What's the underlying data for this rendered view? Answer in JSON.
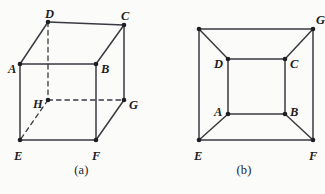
{
  "page": {
    "background_color": "#fbfbf9",
    "ink_color": "#3a3a42",
    "label_color": "#1d1d22",
    "width": 325,
    "height": 194
  },
  "figures": [
    {
      "id": "figure-a",
      "caption": "(a)",
      "description": "Cube drawn in oblique projection with hidden edges dashed",
      "vertices": [
        {
          "name": "D",
          "x": 48,
          "y": 22,
          "label_x": 45,
          "label_y": 14,
          "hidden": false
        },
        {
          "name": "C",
          "x": 124,
          "y": 25,
          "label_x": 121,
          "label_y": 16,
          "hidden": false
        },
        {
          "name": "A",
          "x": 20,
          "y": 64,
          "label_x": 8,
          "label_y": 69,
          "hidden": false
        },
        {
          "name": "B",
          "x": 96,
          "y": 64,
          "label_x": 101,
          "label_y": 69,
          "hidden": false
        },
        {
          "name": "H",
          "x": 48,
          "y": 100,
          "label_x": 33,
          "label_y": 104,
          "hidden": true
        },
        {
          "name": "G",
          "x": 124,
          "y": 100,
          "label_x": 129,
          "label_y": 105,
          "hidden": false
        },
        {
          "name": "E",
          "x": 20,
          "y": 140,
          "label_x": 14,
          "label_y": 156,
          "hidden": false
        },
        {
          "name": "F",
          "x": 96,
          "y": 140,
          "label_x": 92,
          "label_y": 156,
          "hidden": false
        }
      ],
      "edges": [
        {
          "from": "D",
          "to": "C",
          "style": "solid"
        },
        {
          "from": "D",
          "to": "A",
          "style": "solid"
        },
        {
          "from": "C",
          "to": "B",
          "style": "solid"
        },
        {
          "from": "A",
          "to": "B",
          "style": "solid"
        },
        {
          "from": "A",
          "to": "E",
          "style": "solid"
        },
        {
          "from": "B",
          "to": "F",
          "style": "solid"
        },
        {
          "from": "C",
          "to": "G",
          "style": "solid"
        },
        {
          "from": "E",
          "to": "F",
          "style": "solid"
        },
        {
          "from": "F",
          "to": "G",
          "style": "solid"
        },
        {
          "from": "D",
          "to": "H",
          "style": "dashed"
        },
        {
          "from": "H",
          "to": "G",
          "style": "dashed"
        },
        {
          "from": "H",
          "to": "E",
          "style": "dashed"
        }
      ]
    },
    {
      "id": "figure-b",
      "caption": "(b)",
      "description": "Planar (Schlegel) drawing of the same cube, nested squares",
      "vertices": [
        {
          "name": "H",
          "x": 36,
          "y": 29,
          "label_x": null,
          "label_y": null,
          "hidden": false
        },
        {
          "name": "G",
          "x": 150,
          "y": 29,
          "label_x": 153,
          "label_y": 20,
          "hidden": false
        },
        {
          "name": "D",
          "x": 65,
          "y": 59,
          "label_x": 51,
          "label_y": 64,
          "hidden": false
        },
        {
          "name": "C",
          "x": 122,
          "y": 59,
          "label_x": 127,
          "label_y": 64,
          "hidden": false
        },
        {
          "name": "A",
          "x": 65,
          "y": 114,
          "label_x": 51,
          "label_y": 112,
          "hidden": false
        },
        {
          "name": "B",
          "x": 122,
          "y": 114,
          "label_x": 127,
          "label_y": 112,
          "hidden": false
        },
        {
          "name": "E",
          "x": 36,
          "y": 140,
          "label_x": 31,
          "label_y": 156,
          "hidden": false
        },
        {
          "name": "F",
          "x": 150,
          "y": 140,
          "label_x": 146,
          "label_y": 156,
          "hidden": false
        }
      ],
      "edges": [
        {
          "from": "H",
          "to": "G",
          "style": "solid"
        },
        {
          "from": "G",
          "to": "F",
          "style": "solid"
        },
        {
          "from": "F",
          "to": "E",
          "style": "solid"
        },
        {
          "from": "E",
          "to": "H",
          "style": "solid"
        },
        {
          "from": "D",
          "to": "C",
          "style": "solid"
        },
        {
          "from": "C",
          "to": "B",
          "style": "solid"
        },
        {
          "from": "B",
          "to": "A",
          "style": "solid"
        },
        {
          "from": "A",
          "to": "D",
          "style": "solid"
        },
        {
          "from": "H",
          "to": "D",
          "style": "solid"
        },
        {
          "from": "G",
          "to": "C",
          "style": "solid"
        },
        {
          "from": "E",
          "to": "A",
          "style": "solid"
        },
        {
          "from": "F",
          "to": "B",
          "style": "solid"
        }
      ]
    }
  ]
}
